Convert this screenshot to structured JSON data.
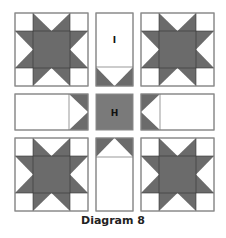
{
  "diagram": {
    "caption": "Diagram 8",
    "colors": {
      "dark": "#6b6b6b",
      "center": "#7a7a7a",
      "outline": "#8a8a8a",
      "background": "#ffffff"
    },
    "layout": {
      "columns": [
        [
          15,
          88
        ],
        [
          96,
          133
        ],
        [
          141,
          214
        ]
      ],
      "rows": [
        [
          13,
          86
        ],
        [
          94,
          130
        ],
        [
          138,
          211
        ]
      ]
    },
    "blocks": [
      {
        "id": "star-block-top-left",
        "type": "sawtooth-star"
      },
      {
        "id": "sashing-top",
        "type": "flying-geese-strip",
        "label": "I",
        "point": "down"
      },
      {
        "id": "star-block-top-right",
        "type": "sawtooth-star"
      },
      {
        "id": "sashing-left",
        "type": "flying-geese-strip",
        "label": "",
        "point": "right"
      },
      {
        "id": "center-square",
        "type": "square",
        "label": "H"
      },
      {
        "id": "sashing-right",
        "type": "flying-geese-strip",
        "label": "",
        "point": "left"
      },
      {
        "id": "star-block-bottom-left",
        "type": "sawtooth-star"
      },
      {
        "id": "sashing-bottom",
        "type": "flying-geese-strip",
        "label": "",
        "point": "up"
      },
      {
        "id": "star-block-bottom-right",
        "type": "sawtooth-star"
      }
    ],
    "labels": {
      "top_strip": "I",
      "center": "H"
    }
  }
}
